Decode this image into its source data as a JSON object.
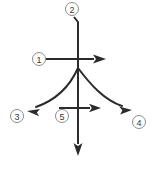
{
  "figure": {
    "width": 160,
    "height": 170,
    "background_color": "#ffffff",
    "stroke_color": "#2b2b2b",
    "callout_outline_color": "#8c8c8c",
    "callout_text_color": "#3a3a3a",
    "origin": {
      "x": 78,
      "y": 67
    }
  },
  "callouts": [
    {
      "id": "1",
      "label": "1",
      "cx": 39,
      "cy": 59,
      "r": 6.5,
      "target": "horizontal-right-arrow"
    },
    {
      "id": "2",
      "label": "2",
      "cx": 72,
      "cy": 9,
      "r": 6.5,
      "target": "vertical-up-line"
    },
    {
      "id": "3",
      "label": "3",
      "cx": 17,
      "cy": 116,
      "r": 6.5,
      "target": "curve-left-arrow"
    },
    {
      "id": "4",
      "label": "4",
      "cx": 139,
      "cy": 122,
      "r": 6.5,
      "target": "curve-right-arrow"
    },
    {
      "id": "5",
      "label": "5",
      "cx": 62,
      "cy": 116,
      "r": 6.5,
      "target": "lower-horizontal-arrow"
    }
  ],
  "vectors": [
    {
      "name": "vertical-up-line",
      "kind": "line",
      "description": "vertical line rising from origin to callout 2",
      "path": "M 78 67 L 78 22 L 74 17",
      "arrow": "none"
    },
    {
      "name": "vertical-down-arrow",
      "kind": "arrow",
      "description": "vertical arrow pointing down from origin",
      "path": "M 78 67 L 78 144",
      "arrow": "down",
      "head": {
        "tip_x": 78,
        "tip_y": 156,
        "width": 9,
        "length": 13
      }
    },
    {
      "name": "horizontal-right-arrow",
      "kind": "arrow",
      "description": "horizontal arrow pointing right through origin from callout 1",
      "path": "M 46 59 L 94 59",
      "arrow": "right",
      "head": {
        "tip_x": 106,
        "tip_y": 59,
        "width": 9,
        "length": 13
      }
    },
    {
      "name": "lower-horizontal-arrow",
      "kind": "arrow",
      "description": "short horizontal arrow pointing right below origin from callout 5",
      "path": "M 59 108 L 90 108",
      "arrow": "right",
      "head": {
        "tip_x": 101,
        "tip_y": 108,
        "width": 8,
        "length": 12
      }
    },
    {
      "name": "curve-left-arrow",
      "kind": "curve",
      "description": "curved arrow sweeping down-left from origin to callout 3",
      "path": "M 78 68 C 70 86 56 100 36 107",
      "arrow": "down-left",
      "head": {
        "tip_x": 27,
        "tip_y": 111,
        "angle_deg": 203
      }
    },
    {
      "name": "curve-right-arrow",
      "kind": "curve",
      "description": "curved arrow sweeping down-right from origin to callout 4",
      "path": "M 78 68 C 90 84 104 100 122 106",
      "arrow": "down-right",
      "head": {
        "tip_x": 132,
        "tip_y": 110,
        "angle_deg": 24
      }
    }
  ]
}
